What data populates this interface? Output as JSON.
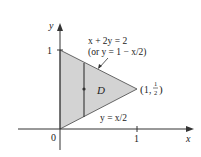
{
  "figure": {
    "type": "region-diagram",
    "region_label": "D",
    "axes": {
      "x_label": "x",
      "y_label": "y",
      "origin_label": "0",
      "x_tick_label": "1",
      "y_tick_label": "1"
    },
    "upper_boundary": {
      "equation": "x + 2y = 2",
      "alt_equation": "(or y = 1 − x/2)"
    },
    "lower_boundary": {
      "equation": "y = x/2"
    },
    "vertex_label": {
      "text": "(1, ½)",
      "x": "1",
      "y_num": "1",
      "y_den": "2"
    },
    "vertices": [
      [
        0,
        0
      ],
      [
        0,
        1
      ],
      [
        1,
        0.5
      ]
    ],
    "colors": {
      "region_fill": "#d3d3d3",
      "lines": "#333333",
      "background": "#ffffff"
    }
  }
}
